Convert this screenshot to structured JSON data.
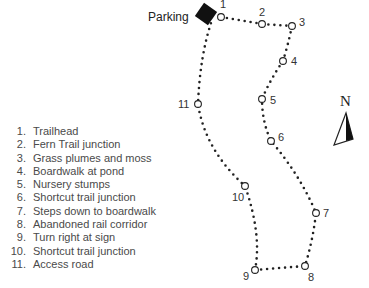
{
  "map": {
    "parking_label": "Parking",
    "north_label": "N",
    "waypoints": [
      {
        "n": "1",
        "x": 221,
        "y": 17,
        "lx": 220,
        "ly": 8
      },
      {
        "n": "2",
        "x": 262,
        "y": 24,
        "lx": 259,
        "ly": 16
      },
      {
        "n": "3",
        "x": 292,
        "y": 26,
        "lx": 299,
        "ly": 26
      },
      {
        "n": "4",
        "x": 283,
        "y": 61,
        "lx": 291,
        "ly": 65
      },
      {
        "n": "5",
        "x": 262,
        "y": 99,
        "lx": 270,
        "ly": 104
      },
      {
        "n": "6",
        "x": 271,
        "y": 141,
        "lx": 278,
        "ly": 141
      },
      {
        "n": "7",
        "x": 316,
        "y": 213,
        "lx": 323,
        "ly": 217
      },
      {
        "n": "8",
        "x": 305,
        "y": 266,
        "lx": 308,
        "ly": 281
      },
      {
        "n": "9",
        "x": 255,
        "y": 270,
        "lx": 243,
        "ly": 280
      },
      {
        "n": "10",
        "x": 245,
        "y": 186,
        "lx": 232,
        "ly": 201
      },
      {
        "n": "11",
        "x": 198,
        "y": 104,
        "lx": 178,
        "ly": 108
      }
    ]
  },
  "legend": [
    {
      "num": "1.",
      "label": "Trailhead"
    },
    {
      "num": "2.",
      "label": "Fern Trail junction"
    },
    {
      "num": "3.",
      "label": "Grass plumes and moss"
    },
    {
      "num": "4.",
      "label": "Boardwalk at pond"
    },
    {
      "num": "5.",
      "label": "Nursery stumps"
    },
    {
      "num": "6.",
      "label": "Shortcut trail junction"
    },
    {
      "num": "7.",
      "label": "Steps down to boardwalk"
    },
    {
      "num": "8.",
      "label": "Abandoned rail corridor"
    },
    {
      "num": "9.",
      "label": "Turn right at sign"
    },
    {
      "num": "10.",
      "label": "Shortcut trail junction"
    },
    {
      "num": "11.",
      "label": "Access road"
    }
  ]
}
